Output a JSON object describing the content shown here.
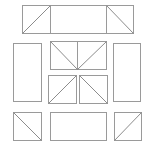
{
  "diagram": {
    "width": 148,
    "height": 147,
    "stroke_color": "#9a9a9a",
    "background_color": "#ffffff",
    "shapes": [
      {
        "id": "top-strip",
        "x": 22.5,
        "y": 5.5,
        "w": 111,
        "h": 28,
        "dividers_x": [
          50.5,
          106.5
        ],
        "diagonals": [
          [
            22.5,
            33.5,
            50.5,
            5.5
          ],
          [
            106.5,
            5.5,
            133.5,
            33.5
          ]
        ]
      },
      {
        "id": "left-tall-box",
        "x": 13.5,
        "y": 43.5,
        "w": 28,
        "h": 58,
        "diagonals": []
      },
      {
        "id": "right-tall-box",
        "x": 113.5,
        "y": 43.5,
        "w": 27,
        "h": 58,
        "diagonals": []
      },
      {
        "id": "center-upper-box",
        "x": 50.5,
        "y": 41.5,
        "w": 56,
        "h": 28,
        "dividers_x": [
          77.5
        ],
        "diagonals": [
          [
            50.5,
            41.5,
            77.5,
            69.5
          ],
          [
            106.5,
            41.5,
            77.5,
            69.5
          ]
        ]
      },
      {
        "id": "center-lower-left-box",
        "x": 48.5,
        "y": 75.5,
        "w": 28,
        "h": 28,
        "diagonals": [
          [
            48.5,
            103.5,
            76.5,
            75.5
          ]
        ]
      },
      {
        "id": "center-lower-right-box",
        "x": 79.5,
        "y": 75.5,
        "w": 28,
        "h": 28,
        "diagonals": [
          [
            79.5,
            75.5,
            107.5,
            103.5
          ]
        ]
      },
      {
        "id": "bottom-left-square",
        "x": 13.5,
        "y": 112.5,
        "w": 28,
        "h": 28,
        "diagonals": [
          [
            13.5,
            112.5,
            41.5,
            140.5
          ]
        ]
      },
      {
        "id": "bottom-center-box",
        "x": 50.5,
        "y": 112.5,
        "w": 56,
        "h": 28,
        "diagonals": []
      },
      {
        "id": "bottom-right-square",
        "x": 114.5,
        "y": 112.5,
        "w": 27,
        "h": 28,
        "diagonals": [
          [
            114.5,
            140.5,
            141.5,
            112.5
          ]
        ]
      }
    ]
  }
}
